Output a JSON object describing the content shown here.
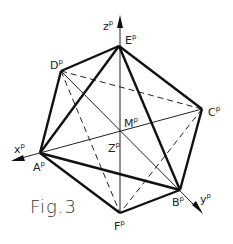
{
  "figure": {
    "caption": "Fig.3",
    "vertices": {
      "A": {
        "label": "A",
        "sup": "p",
        "x": 40,
        "y": 153
      },
      "B": {
        "label": "B",
        "sup": "p",
        "x": 180,
        "y": 190
      },
      "C": {
        "label": "C",
        "sup": "p",
        "x": 202,
        "y": 109
      },
      "D": {
        "label": "D",
        "sup": "p",
        "x": 61,
        "y": 71
      },
      "E": {
        "label": "E",
        "sup": "p",
        "x": 119,
        "y": 46
      },
      "F": {
        "label": "F",
        "sup": "p",
        "x": 120,
        "y": 213
      },
      "M": {
        "label": "M",
        "sup": "p",
        "x": 120,
        "y": 132
      }
    },
    "axes": {
      "x": {
        "label": "x",
        "sup": "p"
      },
      "y": {
        "label": "y",
        "sup": "p"
      },
      "z": {
        "label": "z",
        "sup": "p"
      },
      "z_lower": {
        "label": "Z",
        "sup": "p"
      }
    },
    "edges_visible": [
      "E-D",
      "E-A",
      "E-C",
      "E-B",
      "D-A",
      "A-F",
      "A-B",
      "F-B",
      "B-C"
    ],
    "edges_hidden": [
      "D-C",
      "D-F",
      "D-B",
      "F-C"
    ],
    "axis_lines": [
      "A-C",
      "D-B",
      "E-F"
    ]
  }
}
